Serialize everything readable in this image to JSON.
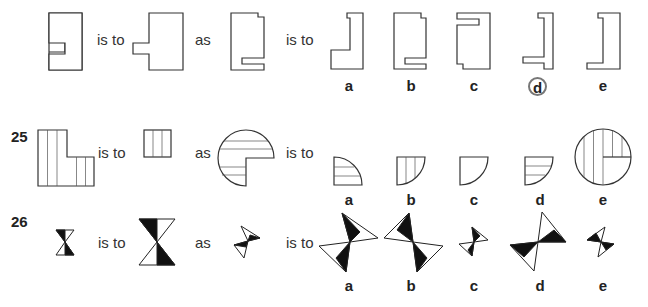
{
  "questions": [
    {
      "number": "",
      "phrase_is_to_1": "is to",
      "phrase_as": "as",
      "phrase_is_to_2": "is to",
      "options": [
        "a",
        "b",
        "c",
        "d",
        "e"
      ],
      "selected_answer": "d"
    },
    {
      "number": "25",
      "phrase_is_to_1": "is to",
      "phrase_as": "as",
      "phrase_is_to_2": "is to",
      "options": [
        "a",
        "b",
        "c",
        "d",
        "e"
      ]
    },
    {
      "number": "26",
      "phrase_is_to_1": "is to",
      "phrase_as": "as",
      "phrase_is_to_2": "is to",
      "options": [
        "a",
        "b",
        "c",
        "d",
        "e"
      ]
    }
  ],
  "colors": {
    "stroke": "#333333",
    "fill_black": "#111111",
    "answer_circle": "#777777"
  }
}
